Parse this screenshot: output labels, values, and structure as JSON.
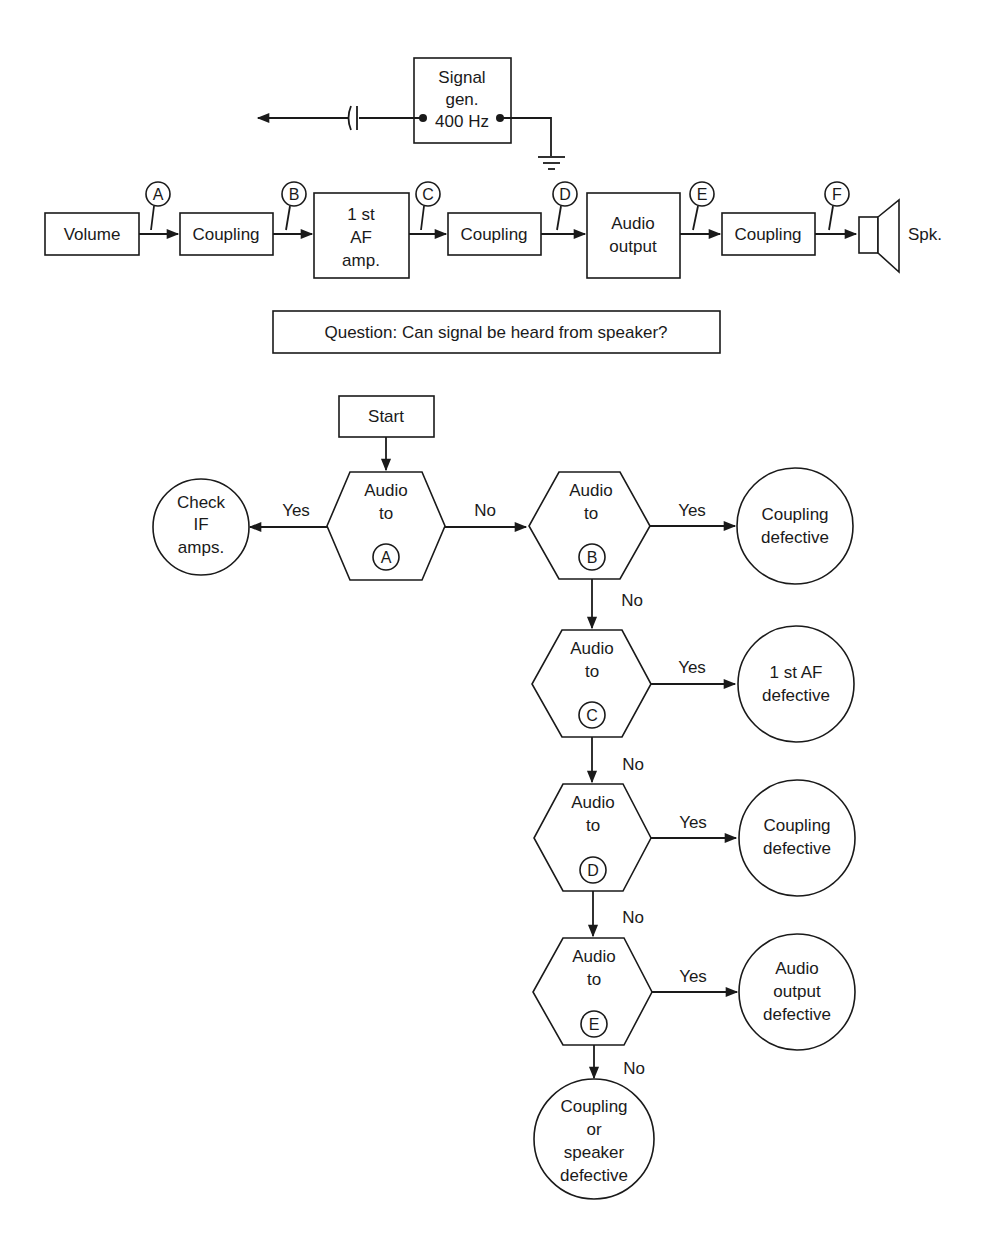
{
  "signal_generator": {
    "lines": [
      "Signal",
      "gen.",
      "400 Hz"
    ]
  },
  "chain": {
    "blocks": [
      {
        "id": "volume",
        "lines": [
          "Volume"
        ]
      },
      {
        "id": "coupling1",
        "lines": [
          "Coupling"
        ]
      },
      {
        "id": "af_amp",
        "lines": [
          "1 st",
          "AF",
          "amp."
        ]
      },
      {
        "id": "coupling2",
        "lines": [
          "Coupling"
        ]
      },
      {
        "id": "audio_output",
        "lines": [
          "Audio",
          "output"
        ]
      },
      {
        "id": "coupling3",
        "lines": [
          "Coupling"
        ]
      }
    ],
    "test_points": [
      "A",
      "B",
      "C",
      "D",
      "E",
      "F"
    ],
    "speaker_label": "Spk."
  },
  "question": "Question:  Can signal be heard from speaker?",
  "flowchart": {
    "start_label": "Start",
    "decisions": [
      {
        "lines": [
          "Audio",
          "to"
        ],
        "point": "A",
        "yes_label": "Yes",
        "no_label": "No",
        "yes_result": [
          "Check",
          "IF",
          "amps."
        ]
      },
      {
        "lines": [
          "Audio",
          "to"
        ],
        "point": "B",
        "yes_label": "Yes",
        "no_label": "No",
        "yes_result": [
          "Coupling",
          "defective"
        ]
      },
      {
        "lines": [
          "Audio",
          "to"
        ],
        "point": "C",
        "yes_label": "Yes",
        "no_label": "No",
        "yes_result": [
          "1 st AF",
          "defective"
        ]
      },
      {
        "lines": [
          "Audio",
          "to"
        ],
        "point": "D",
        "yes_label": "Yes",
        "no_label": "No",
        "yes_result": [
          "Coupling",
          "defective"
        ]
      },
      {
        "lines": [
          "Audio",
          "to"
        ],
        "point": "E",
        "yes_label": "Yes",
        "no_label": "No",
        "yes_result": [
          "Audio",
          "output",
          "defective"
        ]
      }
    ],
    "final_result": [
      "Coupling",
      "or",
      "speaker",
      "defective"
    ]
  }
}
